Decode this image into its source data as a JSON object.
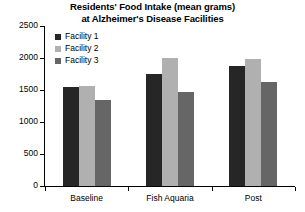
{
  "chart_data": {
    "type": "bar",
    "title": "Residents' Food Intake (mean grams) at Alzheimer's Disease Facilities",
    "title_lines": [
      "Residents' Food Intake (mean grams)",
      "at Alzheimer's Disease Facilities"
    ],
    "xlabel": "",
    "ylabel": "",
    "categories": [
      "Baseline",
      "Fish Aquaria",
      "Post"
    ],
    "series": [
      {
        "name": "Facility 1",
        "color": "#262626",
        "values": [
          1550,
          1750,
          1880
        ]
      },
      {
        "name": "Facility 2",
        "color": "#b0b0b0",
        "values": [
          1560,
          2000,
          1980
        ]
      },
      {
        "name": "Facility 3",
        "color": "#666666",
        "values": [
          1340,
          1470,
          1620
        ]
      }
    ],
    "ylim": [
      0,
      2500
    ],
    "yticks": [
      0,
      500,
      1000,
      1500,
      2000,
      2500
    ],
    "ytick_labels": [
      "0",
      "500",
      "1000",
      "1500",
      "2000",
      "2500"
    ],
    "grid": false,
    "legend_position": "upper-left-inside"
  },
  "legend": {
    "entries": [
      {
        "label": "Facility 1",
        "color": "#262626"
      },
      {
        "label": "Facility 2",
        "color": "#b0b0b0"
      },
      {
        "label": "Facility 3",
        "color": "#666666"
      }
    ]
  },
  "axis_color": "#000000"
}
